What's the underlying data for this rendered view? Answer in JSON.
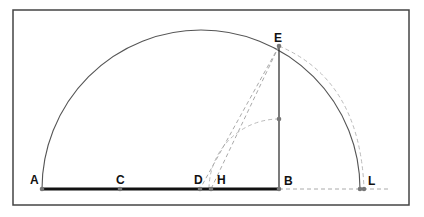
{
  "diagram": {
    "type": "geometric-construction",
    "colors": {
      "frame": "#444444",
      "arc": "#555555",
      "segment": "#111111",
      "dashed": "#aaaaaa",
      "point": "#777777",
      "label": "#111111"
    },
    "points": {
      "A": {
        "label": "A",
        "x": 42,
        "y": 189
      },
      "C": {
        "label": "C",
        "x": 120,
        "y": 189
      },
      "D": {
        "label": "D",
        "x": 200,
        "y": 189
      },
      "H": {
        "label": "H",
        "x": 211,
        "y": 189
      },
      "B": {
        "label": "B",
        "x": 279,
        "y": 189
      },
      "L": {
        "label": "L",
        "x": 362,
        "y": 189
      },
      "E": {
        "label": "E",
        "x": 279,
        "y": 46
      }
    },
    "segments": [
      {
        "from": "A",
        "to": "B",
        "style": "thick-solid"
      },
      {
        "from": "B",
        "to": "E",
        "style": "solid"
      },
      {
        "from": "E",
        "to": "D",
        "style": "dashed"
      },
      {
        "from": "E",
        "to": "H",
        "style": "dashed"
      },
      {
        "from": "B",
        "to": "L",
        "style": "dashed-extension"
      }
    ],
    "arcs": [
      {
        "name": "main-semicircle",
        "center": "D",
        "style": "solid"
      },
      {
        "name": "outer-arc-near-L",
        "style": "dashed"
      },
      {
        "name": "small-arc-B-center",
        "center": "B",
        "style": "dashed"
      }
    ]
  }
}
